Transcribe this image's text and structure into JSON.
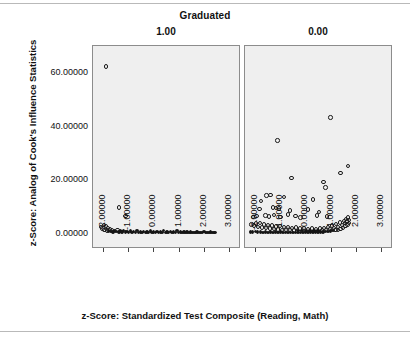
{
  "chart_data": {
    "type": "scatter",
    "title": "Graduated",
    "xlabel": "z-Score: Standardized Test Composite (Reading, Math)",
    "ylabel": "z-Score: Analog of Cook's Influence Statistics",
    "grid": false,
    "legend": "none",
    "xlim": [
      -2.45,
      3.45
    ],
    "ylim": [
      -5.5,
      70.0
    ],
    "xticks": [
      "-2.00000",
      "-1.00000",
      "0.00000",
      "1.00000",
      "2.00000",
      "3.00000"
    ],
    "xtick_values": [
      -2,
      -1,
      0,
      1,
      2,
      3
    ],
    "yticks": [
      "0.00000",
      "20.00000",
      "40.00000",
      "60.00000"
    ],
    "ytick_values": [
      0,
      20,
      40,
      60
    ],
    "panels": [
      {
        "label": "1.00",
        "points": [
          [
            -1.9,
            62.0
          ],
          [
            -1.38,
            9.6
          ],
          [
            -1.12,
            6.3
          ],
          [
            -2.08,
            2.2
          ],
          [
            -2.03,
            1.7
          ],
          [
            -1.97,
            3.0
          ],
          [
            -1.95,
            1.2
          ],
          [
            -1.9,
            2.6
          ],
          [
            -1.86,
            1.0
          ],
          [
            -1.82,
            1.9
          ],
          [
            -1.79,
            0.8
          ],
          [
            -1.74,
            1.5
          ],
          [
            -1.7,
            0.6
          ],
          [
            -1.66,
            1.1
          ],
          [
            -1.61,
            0.5
          ],
          [
            -1.56,
            0.9
          ],
          [
            -1.5,
            0.7
          ],
          [
            -1.44,
            1.2
          ],
          [
            -1.38,
            0.5
          ],
          [
            -1.31,
            0.8
          ],
          [
            -1.25,
            0.4
          ],
          [
            -1.19,
            0.9
          ],
          [
            -1.12,
            0.4
          ],
          [
            -1.05,
            0.7
          ],
          [
            -0.99,
            0.3
          ],
          [
            -0.92,
            0.8
          ],
          [
            -0.86,
            0.3
          ],
          [
            -0.79,
            0.6
          ],
          [
            -0.72,
            0.3
          ],
          [
            -0.66,
            0.9
          ],
          [
            -0.59,
            0.3
          ],
          [
            -0.52,
            0.5
          ],
          [
            -0.46,
            0.2
          ],
          [
            -0.39,
            0.7
          ],
          [
            -0.32,
            0.2
          ],
          [
            -0.26,
            0.5
          ],
          [
            -0.19,
            0.2
          ],
          [
            -0.12,
            0.8
          ],
          [
            -0.06,
            0.2
          ],
          [
            0.01,
            0.4
          ],
          [
            0.08,
            0.2
          ],
          [
            0.14,
            0.6
          ],
          [
            0.21,
            0.2
          ],
          [
            0.28,
            0.5
          ],
          [
            0.34,
            0.2
          ],
          [
            0.41,
            0.9
          ],
          [
            0.48,
            0.2
          ],
          [
            0.54,
            0.4
          ],
          [
            0.61,
            0.2
          ],
          [
            0.68,
            0.6
          ],
          [
            0.74,
            0.2
          ],
          [
            0.81,
            0.5
          ],
          [
            0.88,
            0.2
          ],
          [
            0.94,
            0.9
          ],
          [
            1.01,
            0.2
          ],
          [
            1.08,
            0.4
          ],
          [
            1.14,
            0.2
          ],
          [
            1.21,
            0.5
          ],
          [
            1.28,
            0.2
          ],
          [
            1.34,
            0.4
          ],
          [
            1.41,
            0.2
          ],
          [
            1.48,
            0.5
          ],
          [
            1.54,
            0.2
          ],
          [
            1.61,
            0.3
          ],
          [
            1.68,
            0.2
          ],
          [
            1.74,
            0.4
          ],
          [
            1.81,
            0.2
          ],
          [
            1.88,
            0.3
          ],
          [
            1.94,
            0.2
          ],
          [
            2.01,
            0.6
          ],
          [
            2.08,
            0.2
          ],
          [
            2.14,
            0.3
          ],
          [
            2.21,
            0.2
          ],
          [
            2.28,
            0.4
          ],
          [
            2.34,
            0.2
          ],
          [
            2.41,
            0.3
          ],
          [
            2.45,
            0.2
          ]
        ]
      },
      {
        "label": "0.00",
        "points": [
          [
            1.0,
            43.0
          ],
          [
            -1.12,
            34.5
          ],
          [
            1.7,
            25.0
          ],
          [
            1.4,
            22.5
          ],
          [
            -0.55,
            20.5
          ],
          [
            0.72,
            19.0
          ],
          [
            0.8,
            17.0
          ],
          [
            -1.56,
            14.0
          ],
          [
            -1.4,
            14.2
          ],
          [
            -0.85,
            13.5
          ],
          [
            -1.77,
            12.0
          ],
          [
            0.3,
            12.5
          ],
          [
            -1.83,
            9.0
          ],
          [
            -1.3,
            9.5
          ],
          [
            -1.18,
            9.3
          ],
          [
            -1.06,
            9.2
          ],
          [
            -0.62,
            8.5
          ],
          [
            0.1,
            8.8
          ],
          [
            0.55,
            8.0
          ],
          [
            -2.1,
            6.0
          ],
          [
            -1.95,
            6.4
          ],
          [
            -1.6,
            6.6
          ],
          [
            -1.45,
            6.2
          ],
          [
            -1.25,
            6.8
          ],
          [
            -1.0,
            6.1
          ],
          [
            -0.7,
            6.9
          ],
          [
            -0.4,
            6.3
          ],
          [
            -0.2,
            5.9
          ],
          [
            0.45,
            6.6
          ],
          [
            0.85,
            6.2
          ],
          [
            -2.15,
            3.2
          ],
          [
            -2.05,
            2.8
          ],
          [
            -1.98,
            3.6
          ],
          [
            -1.9,
            2.4
          ],
          [
            -1.82,
            3.9
          ],
          [
            -1.74,
            2.1
          ],
          [
            -1.66,
            3.3
          ],
          [
            -1.58,
            1.9
          ],
          [
            -1.5,
            3.1
          ],
          [
            -1.42,
            1.7
          ],
          [
            -1.34,
            2.8
          ],
          [
            -1.26,
            1.6
          ],
          [
            -1.18,
            2.5
          ],
          [
            -1.1,
            1.4
          ],
          [
            -1.02,
            2.6
          ],
          [
            -0.94,
            1.3
          ],
          [
            -0.86,
            2.2
          ],
          [
            -0.78,
            1.2
          ],
          [
            -0.7,
            2.4
          ],
          [
            -0.62,
            1.1
          ],
          [
            -0.54,
            2.0
          ],
          [
            -0.46,
            1.0
          ],
          [
            -0.38,
            2.1
          ],
          [
            -0.3,
            0.9
          ],
          [
            -0.22,
            1.8
          ],
          [
            -0.14,
            0.9
          ],
          [
            -0.06,
            1.9
          ],
          [
            0.02,
            0.8
          ],
          [
            0.1,
            1.6
          ],
          [
            0.18,
            0.8
          ],
          [
            0.26,
            1.7
          ],
          [
            0.34,
            0.8
          ],
          [
            0.42,
            1.5
          ],
          [
            0.5,
            0.9
          ],
          [
            0.58,
            1.8
          ],
          [
            0.66,
            1.0
          ],
          [
            0.74,
            2.0
          ],
          [
            0.82,
            1.2
          ],
          [
            0.9,
            2.3
          ],
          [
            0.98,
            1.5
          ],
          [
            1.06,
            2.8
          ],
          [
            1.14,
            1.9
          ],
          [
            1.22,
            3.4
          ],
          [
            1.3,
            2.4
          ],
          [
            1.38,
            4.0
          ],
          [
            1.46,
            3.0
          ],
          [
            1.54,
            4.6
          ],
          [
            1.58,
            3.8
          ],
          [
            1.62,
            5.2
          ],
          [
            1.66,
            4.4
          ],
          [
            1.7,
            5.8
          ],
          [
            1.74,
            5.0
          ],
          [
            -2.2,
            0.5
          ],
          [
            -2.1,
            0.4
          ],
          [
            -2.0,
            0.6
          ],
          [
            -1.9,
            0.4
          ],
          [
            -1.8,
            0.5
          ],
          [
            -1.7,
            0.3
          ],
          [
            -1.6,
            0.5
          ],
          [
            -1.5,
            0.3
          ],
          [
            -1.4,
            0.4
          ],
          [
            -1.3,
            0.3
          ],
          [
            -1.2,
            0.4
          ],
          [
            -1.1,
            0.3
          ],
          [
            -1.0,
            0.4
          ],
          [
            -0.9,
            0.3
          ],
          [
            -0.8,
            0.3
          ],
          [
            -0.7,
            0.3
          ],
          [
            -0.6,
            0.3
          ],
          [
            -0.5,
            0.3
          ],
          [
            -0.4,
            0.3
          ],
          [
            -0.3,
            0.3
          ],
          [
            -0.2,
            0.3
          ],
          [
            -0.1,
            0.3
          ],
          [
            0.0,
            0.3
          ],
          [
            0.1,
            0.3
          ],
          [
            0.2,
            0.3
          ],
          [
            0.3,
            0.4
          ],
          [
            0.4,
            0.4
          ],
          [
            0.5,
            0.4
          ],
          [
            0.6,
            0.5
          ],
          [
            0.7,
            0.5
          ],
          [
            0.8,
            0.6
          ],
          [
            0.9,
            0.7
          ],
          [
            1.0,
            0.8
          ],
          [
            1.1,
            0.9
          ],
          [
            1.2,
            1.1
          ],
          [
            1.3,
            1.3
          ],
          [
            1.4,
            1.6
          ],
          [
            1.5,
            2.0
          ],
          [
            1.6,
            2.6
          ],
          [
            1.68,
            3.2
          ],
          [
            1.74,
            3.9
          ]
        ]
      }
    ]
  }
}
